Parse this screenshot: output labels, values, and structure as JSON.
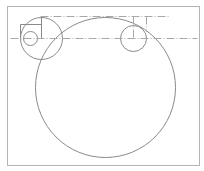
{
  "canvas": {
    "width": 204,
    "height": 171,
    "background": "#ffffff"
  },
  "colors": {
    "frame": "#b4b4b4",
    "geometry": "#8a8a8a",
    "centerline": "#a8a8a8"
  },
  "frame": {
    "x": 7,
    "y": 6,
    "width": 192,
    "height": 159
  },
  "circles": [
    {
      "id": "large-circle",
      "cx": 105,
      "cy": 87,
      "r": 70
    },
    {
      "id": "top-left-circle",
      "cx": 41,
      "cy": 38,
      "r": 21
    },
    {
      "id": "small-left-circle",
      "cx": 30,
      "cy": 38,
      "r": 7
    },
    {
      "id": "right-circle",
      "cx": 133,
      "cy": 38,
      "r": 13
    }
  ],
  "lines": [
    {
      "id": "left-vertical-line",
      "x1": 41,
      "y1": 16,
      "x2": 41,
      "y2": 38,
      "style": "solid"
    },
    {
      "id": "rect-top-line",
      "x1": 20,
      "y1": 24,
      "x2": 41,
      "y2": 24,
      "style": "solid"
    },
    {
      "id": "rect-left-line",
      "x1": 20,
      "y1": 24,
      "x2": 20,
      "y2": 38,
      "style": "solid"
    }
  ],
  "centerlines": [
    {
      "id": "top-centerline",
      "x1": 40,
      "y1": 16,
      "x2": 168,
      "y2": 16
    },
    {
      "id": "horizontal-centerline",
      "x1": 10,
      "y1": 38,
      "x2": 197,
      "y2": 38
    },
    {
      "id": "right-circle-vertical-centerline",
      "x1": 133,
      "y1": 16,
      "x2": 133,
      "y2": 38
    },
    {
      "id": "right-vertical-centerline",
      "x1": 146,
      "y1": 16,
      "x2": 146,
      "y2": 31
    }
  ],
  "dash_pattern": "8 2 1 2"
}
